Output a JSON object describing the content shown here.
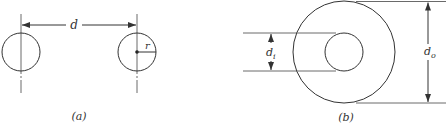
{
  "figure_a": {
    "caption": "(a)",
    "distance_label": "d",
    "radius_label": "r",
    "left_circle": {
      "cx": 21,
      "cy": 52,
      "r": 19
    },
    "right_circle": {
      "cx": 137,
      "cy": 52,
      "r": 19
    }
  },
  "figure_b": {
    "caption": "(b)",
    "inner_diameter_label": "d",
    "inner_diameter_subscript": "i",
    "outer_diameter_label": "d",
    "outer_diameter_subscript": "o",
    "outer_circle": {
      "cx": 344,
      "cy": 52,
      "r": 51
    },
    "inner_circle": {
      "cx": 344,
      "cy": 52,
      "r": 19
    }
  },
  "colors": {
    "stroke": "#333333",
    "background": "#ffffff"
  }
}
